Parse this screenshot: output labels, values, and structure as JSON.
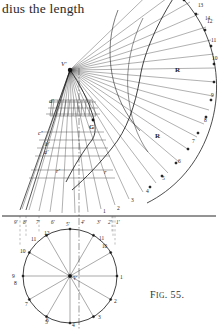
{
  "page": {
    "body_text_fragment": "dius the length",
    "figure_caption_prefix": "F",
    "figure_caption_smallcaps": "IG",
    "figure_caption_suffix": ". 55.",
    "figure_caption_full": "Fig. 55."
  },
  "figure": {
    "title": "Fig. 55.",
    "ink_color": "#1b1b1b",
    "light_ink_color": "#5a5a5a",
    "apex_label": "V'",
    "plan_center_label": "V",
    "curve_labels": [
      "R",
      "R"
    ],
    "point_G_label": "G",
    "left_labels": [
      "d'",
      "c'",
      "b'",
      "a'",
      "r'"
    ],
    "inner_label": "r",
    "arc_division_labels": [
      "1",
      "2",
      "3",
      "4",
      "5",
      "6",
      "7",
      "8",
      "9",
      "10",
      "11",
      "12"
    ],
    "arc_top_labels": [
      "13",
      "14",
      "1"
    ],
    "ground_line_labels": [
      "9'",
      "8'",
      "7'",
      "6'",
      "5'",
      "4'",
      "3'",
      "2'",
      "1'"
    ],
    "baseline_right_labels": [
      "1'",
      "2",
      "3",
      "4",
      "5"
    ],
    "plan_circle_labels": [
      "1",
      "2",
      "3",
      "4",
      "5",
      "6",
      "7",
      "8",
      "9",
      "10",
      "11",
      "12"
    ],
    "plan_circle_divisions": 12,
    "fan_ray_count": 28
  }
}
